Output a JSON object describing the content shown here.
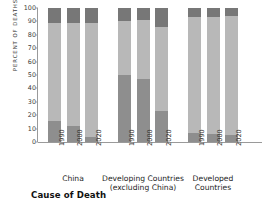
{
  "chart_data": {
    "type": "bar",
    "variant": "stacked-vertical-grouped",
    "title": "",
    "caption": "Cause of Death",
    "xlabel": "",
    "ylabel": "PERCENT OF DEATHS",
    "ylim": [
      0,
      100
    ],
    "yticks": [
      0,
      10,
      20,
      30,
      40,
      50,
      60,
      70,
      80,
      90,
      100
    ],
    "ytick_labels": [
      "0",
      "10",
      "20",
      "30",
      "40",
      "50",
      "60",
      "70",
      "80",
      "90",
      "100"
    ],
    "grid": false,
    "legend": "none",
    "stacking": "percent",
    "categories": [
      "1990",
      "2000",
      "2020"
    ],
    "groups": [
      {
        "name": "China",
        "label_lines": [
          "China"
        ],
        "bars": [
          {
            "category": "1990",
            "segments": [
              16,
              73,
              11
            ]
          },
          {
            "category": "2000",
            "segments": [
              12,
              77,
              11
            ]
          },
          {
            "category": "2020",
            "segments": [
              4,
              85,
              11
            ]
          }
        ]
      },
      {
        "name": "Developing Countries (excluding China)",
        "label_lines": [
          "Developing Countries",
          "(excluding China)"
        ],
        "bars": [
          {
            "category": "1990",
            "segments": [
              50,
              40,
              10
            ]
          },
          {
            "category": "2000",
            "segments": [
              47,
              44,
              9
            ]
          },
          {
            "category": "2020",
            "segments": [
              23,
              63,
              14
            ]
          }
        ]
      },
      {
        "name": "Developed Countries",
        "label_lines": [
          "Developed",
          "Countries"
        ],
        "bars": [
          {
            "category": "1990",
            "segments": [
              7,
              86,
              7
            ]
          },
          {
            "category": "2000",
            "segments": [
              6,
              87,
              7
            ]
          },
          {
            "category": "2020",
            "segments": [
              5.5,
              88.5,
              6
            ]
          }
        ]
      }
    ],
    "series": [
      {
        "name": "segment-bottom",
        "color": "#8e8e8e"
      },
      {
        "name": "segment-middle",
        "color": "#b8b8b8"
      },
      {
        "name": "segment-top",
        "color": "#777777"
      }
    ]
  },
  "colors": {
    "bottom": "#8e8e8e",
    "middle": "#b8b8b8",
    "top": "#777777",
    "axis": "#9a9a9a",
    "text": "#2f2f2f",
    "background": "#ffffff"
  }
}
